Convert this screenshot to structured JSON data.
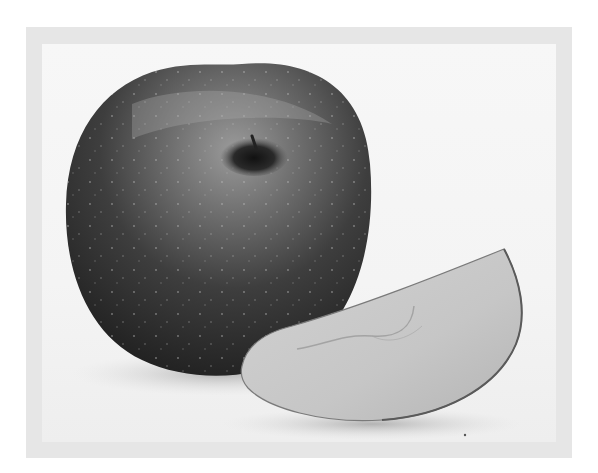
{
  "image": {
    "kind": "photograph",
    "alt": "A whole apple with a cut wedge slice resting against it, shown in grayscale inside a light gray frame",
    "subjects": [
      {
        "name": "whole-apple",
        "description": "Round apple with a stem cavity at top, dark speckled skin"
      },
      {
        "name": "apple-slice",
        "description": "Crescent-shaped wedge slice showing pale flesh with a faint core outline"
      }
    ],
    "colors": {
      "frame": "#e6e6e6",
      "background": "#f5f5f5",
      "apple_dark": "#2a2a2a",
      "apple_mid": "#6a6a6a",
      "slice_flesh": "#c9c9c9"
    }
  }
}
